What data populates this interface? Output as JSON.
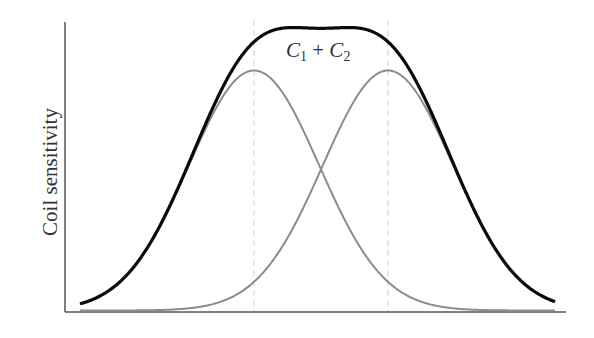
{
  "chart_data": {
    "type": "line",
    "title": "",
    "xlabel": "",
    "ylabel": "Coil sensitivity",
    "annotations": [
      {
        "text": "C1 + C2",
        "parts": [
          "C",
          "1",
          " + ",
          "C",
          "2"
        ],
        "position": "above sum curve, center"
      }
    ],
    "grid": false,
    "legend": "none",
    "x_ticks": [],
    "y_ticks": [],
    "series": [
      {
        "name": "C1",
        "shape": "gaussian",
        "center": 0.39,
        "sigma": 0.13,
        "peak": 0.83,
        "color": "#8c8c8c",
        "style": "solid"
      },
      {
        "name": "C2",
        "shape": "gaussian",
        "center": 0.65,
        "sigma": 0.13,
        "peak": 0.83,
        "color": "#8c8c8c",
        "style": "solid"
      },
      {
        "name": "C1 + C2",
        "shape": "sum",
        "peak": 0.99,
        "color": "#000000",
        "style": "solid-bold"
      }
    ],
    "reference_lines": [
      {
        "orientation": "vertical",
        "x": 0.39,
        "style": "dashed",
        "color": "#d0d0d0"
      },
      {
        "orientation": "vertical",
        "x": 0.65,
        "style": "dashed",
        "color": "#d0d0d0"
      }
    ],
    "geometry_px": {
      "axis_origin": [
        65,
        312
      ],
      "y_axis_top": 22,
      "x_axis_right": 566,
      "curve_x_range": [
        80,
        555
      ],
      "c1_center": 254,
      "c2_center": 388,
      "sigma": 65,
      "peak_height": 240
    }
  },
  "labels": {
    "ylabel": "Coil sensitivity",
    "sum_c": "C",
    "sum_sub1": "1",
    "sum_plus": " + ",
    "sum_sub2": "2"
  }
}
